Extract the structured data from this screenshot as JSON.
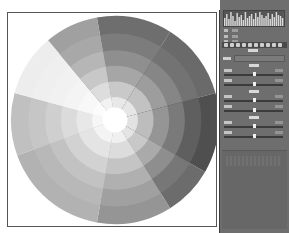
{
  "canvas": {
    "wheel": {
      "cx": 107,
      "cy": 107,
      "radius": 104,
      "sectors": [
        {
          "start": -100,
          "end": -58,
          "shades": [
            "#e8e8e8",
            "#c9c9c9",
            "#a6a6a6",
            "#8f8f8f",
            "#7c7c7c",
            "#6e6e6e"
          ]
        },
        {
          "start": -58,
          "end": -15,
          "shades": [
            "#e6e6e6",
            "#c2c2c2",
            "#9d9d9d",
            "#868686",
            "#737373",
            "#6a6a6a"
          ]
        },
        {
          "start": -15,
          "end": 30,
          "shades": [
            "#e2e2e2",
            "#bdbdbd",
            "#959595",
            "#7a7a7a",
            "#5f5f5f",
            "#4f4f4f"
          ]
        },
        {
          "start": 30,
          "end": 58,
          "shades": [
            "#e4e4e4",
            "#c8c8c8",
            "#aaaaaa",
            "#8e8e8e",
            "#777777",
            "#6c6c6c"
          ]
        },
        {
          "start": 58,
          "end": 100,
          "shades": [
            "#f0f0f0",
            "#dcdcdc",
            "#c4c4c4",
            "#b0b0b0",
            "#a0a0a0",
            "#959595"
          ]
        },
        {
          "start": 100,
          "end": 160,
          "shades": [
            "#f4f4f4",
            "#e4e4e4",
            "#d2d2d2",
            "#c2c2c2",
            "#b8b8b8",
            "#b2b2b2"
          ]
        },
        {
          "start": 160,
          "end": 195,
          "shades": [
            "#f6f6f6",
            "#e8e8e8",
            "#dbdbdb",
            "#cfcfcf",
            "#c6c6c6",
            "#c0c0c0"
          ]
        },
        {
          "start": 195,
          "end": 230,
          "shades": [
            "#fcfcfc",
            "#f8f8f8",
            "#f4f4f4",
            "#f1f1f1",
            "#efefef",
            "#ededed"
          ]
        },
        {
          "start": 230,
          "end": 260,
          "shades": [
            "#f2f2f2",
            "#dddddd",
            "#c8c8c8",
            "#b6b6b6",
            "#a8a8a8",
            "#a0a0a0"
          ]
        }
      ],
      "ring_fractions": [
        0.22,
        0.37,
        0.52,
        0.67,
        0.83,
        1.0
      ],
      "center_color": "#ffffff"
    }
  },
  "panel": {
    "histogram_bars": [
      10,
      14,
      9,
      16,
      12,
      7,
      15,
      11,
      13,
      8,
      16,
      10,
      12,
      14,
      9,
      15,
      11,
      16,
      13,
      10,
      12,
      15,
      9,
      14,
      11,
      16,
      13,
      12,
      10,
      15
    ],
    "info_rows": 3,
    "tool_icons": [
      "tool-1-icon",
      "tool-2-icon",
      "tool-3-icon",
      "tool-4-icon",
      "tool-5-icon",
      "tool-6-icon",
      "tool-7-icon",
      "tool-8-icon",
      "tool-9-icon",
      "tool-10-icon"
    ],
    "preset": {
      "label": "",
      "value": ""
    },
    "groups": [
      {
        "title": "",
        "top": 64,
        "sliders": [
          {
            "label": "",
            "value": "",
            "pos": 0.5
          },
          {
            "label": "",
            "value": "",
            "pos": 0.5
          }
        ]
      },
      {
        "title": "",
        "top": 90,
        "sliders": [
          {
            "label": "",
            "value": "",
            "pos": 0.5
          },
          {
            "label": "",
            "value": "",
            "pos": 0.5
          }
        ]
      },
      {
        "title": "",
        "top": 116,
        "sliders": [
          {
            "label": "",
            "value": "",
            "pos": 0.5
          },
          {
            "label": "",
            "value": "",
            "pos": 0.5
          }
        ]
      }
    ]
  }
}
